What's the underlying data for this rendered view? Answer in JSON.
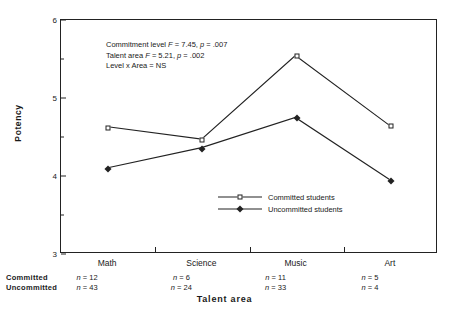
{
  "chart_data": {
    "type": "line",
    "title": "",
    "xlabel": "Talent  area",
    "ylabel": "Potency",
    "categories": [
      "Math",
      "Science",
      "Music",
      "Art"
    ],
    "ylim": [
      3,
      6
    ],
    "yticks": [
      3,
      4,
      5,
      6
    ],
    "yticks_minor": [
      3.5,
      4.5,
      5.5
    ],
    "grid": false,
    "legend_position": "center",
    "series": [
      {
        "name": "Committed students",
        "marker": "open-square",
        "values": [
          4.62,
          4.46,
          5.54,
          4.64
        ]
      },
      {
        "name": "Uncommitted students",
        "marker": "filled-diamond",
        "values": [
          4.09,
          4.35,
          4.74,
          3.94
        ]
      }
    ],
    "annotations": [
      "Commitment level F = 7.45, p = .007",
      "Talent area F = 5.21, p = .002",
      "Level x Area = NS"
    ],
    "sample_sizes": {
      "row_labels": [
        "Committed",
        "Uncommitted"
      ],
      "committed": [
        "n = 12",
        "n = 6",
        "n = 11",
        "n = 5"
      ],
      "uncommitted": [
        "n = 43",
        "n = 24",
        "n = 33",
        "n = 4"
      ]
    }
  },
  "stats": {
    "line1": {
      "pre": "Commitment level ",
      "f_sym": "F",
      "f_val": " = 7.45, ",
      "p_sym": "p",
      "p_val": " = .007"
    },
    "line2": {
      "pre": "Talent area ",
      "f_sym": "F",
      "f_val": " = 5.21, ",
      "p_sym": "p",
      "p_val": " = .002"
    },
    "line3": "Level x Area = NS"
  },
  "axes": {
    "y_title": "Potency",
    "x_title": "Talent  area",
    "y_tick_labels": [
      "3",
      "4",
      "5",
      "6"
    ]
  },
  "legend": {
    "items": [
      {
        "label": "Committed students"
      },
      {
        "label": "Uncommitted students"
      }
    ]
  },
  "colors": {
    "line": "#222222",
    "marker_fill": "#ffffff",
    "background": "#ffffff"
  }
}
